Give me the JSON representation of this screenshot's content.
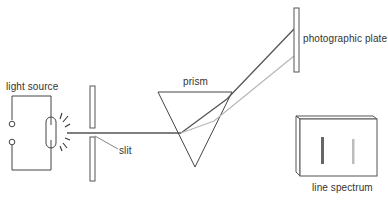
{
  "diagram": {
    "labels": {
      "light_source": "light source",
      "slit": "slit",
      "prism": "prism",
      "photographic_plate": "photographic plate",
      "line_spectrum": "line spectrum"
    },
    "components": [
      {
        "id": "light-source",
        "type": "gas discharge lamp with circuit"
      },
      {
        "id": "slit",
        "type": "double plate slit"
      },
      {
        "id": "prism",
        "type": "triangular prism"
      },
      {
        "id": "photographic-plate",
        "type": "plate"
      },
      {
        "id": "line-spectrum",
        "type": "plate showing two spectral lines"
      }
    ],
    "rays": [
      {
        "name": "dark-ray",
        "color": "#555555"
      },
      {
        "name": "light-ray",
        "color": "#b8b8b8"
      }
    ],
    "spectrum_lines": [
      {
        "name": "dark-line",
        "color": "#666666"
      },
      {
        "name": "light-line",
        "color": "#bdbdbd"
      }
    ]
  }
}
